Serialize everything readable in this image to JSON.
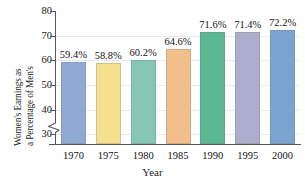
{
  "chart_data": {
    "type": "bar",
    "title": "",
    "xlabel": "Year",
    "ylabel_line1": "Women's Earnings as",
    "ylabel_line2": "a Percentage of Men's",
    "categories": [
      "1970",
      "1975",
      "1980",
      "1985",
      "1990",
      "1995",
      "2000"
    ],
    "values": [
      59.4,
      58.8,
      60.2,
      64.6,
      71.6,
      71.4,
      72.2
    ],
    "data_labels": [
      "59.4%",
      "58.8%",
      "60.2%",
      "64.6%",
      "71.6%",
      "71.4%",
      "72.2%"
    ],
    "ylim": [
      26,
      80
    ],
    "yticks": [
      30,
      40,
      50,
      60,
      70,
      80
    ],
    "ytick_labels": [
      "30",
      "40",
      "50",
      "60",
      "70",
      "80"
    ],
    "axis_break": true,
    "grid": true,
    "legend": "none",
    "bar_colors": [
      "#8fabd4",
      "#f5e08f",
      "#85c6b4",
      "#f2bf8c",
      "#5cb794",
      "#adaecd",
      "#7ba3d0"
    ]
  }
}
